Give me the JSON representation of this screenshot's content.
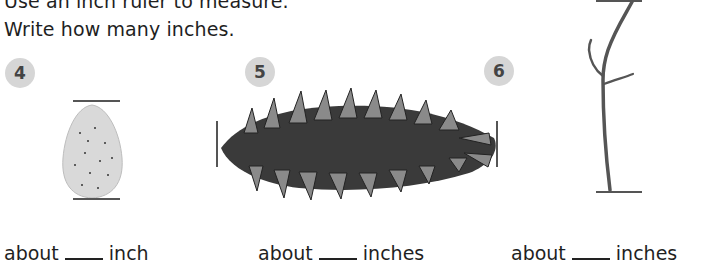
{
  "instructions": {
    "line1": "Use an inch ruler to measure.",
    "line2": "Write how many inches."
  },
  "problems": [
    {
      "number": "4",
      "object": "almond",
      "answer_prefix": "about",
      "answer_value": "",
      "answer_unit": "inch"
    },
    {
      "number": "5",
      "object": "pine cone",
      "answer_prefix": "about",
      "answer_value": "",
      "answer_unit": "inches"
    },
    {
      "number": "6",
      "object": "twig",
      "answer_prefix": "about",
      "answer_value": "",
      "answer_unit": "inches"
    }
  ],
  "colors": {
    "badge_bg": "#d6d6d6",
    "badge_text": "#444444",
    "measure_line": "#555555"
  }
}
